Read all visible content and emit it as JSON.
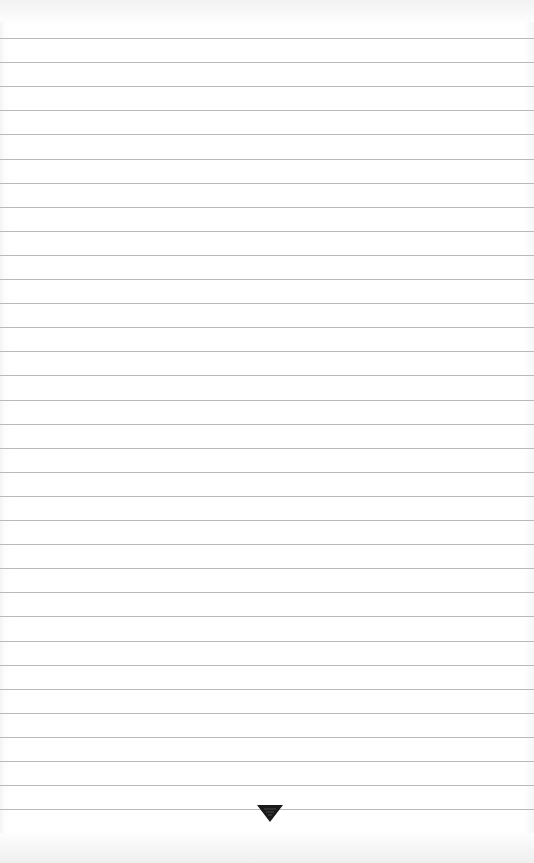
{
  "page": {
    "type": "lined-paper",
    "line_count": 33,
    "first_line_y": 38,
    "line_spacing": 24.1,
    "line_color": "#b9b9b9",
    "background_color": "#ffffff"
  },
  "footer": {
    "icon": "down-triangle-ornament-icon",
    "icon_color": "#1a1a1a"
  }
}
